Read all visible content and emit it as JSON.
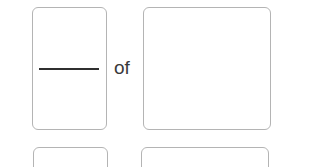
{
  "worksheet": {
    "rows": [
      {
        "fraction_box": {
          "numerator": "",
          "denominator": ""
        },
        "connector": "of",
        "whole_box": {
          "value": ""
        }
      },
      {
        "fraction_box": {
          "numerator": "",
          "denominator": ""
        },
        "whole_box": {
          "value": ""
        }
      }
    ]
  },
  "colors": {
    "box_border": "#b4b4b4",
    "line": "#2f2f2f",
    "text": "#3a3a3a"
  }
}
